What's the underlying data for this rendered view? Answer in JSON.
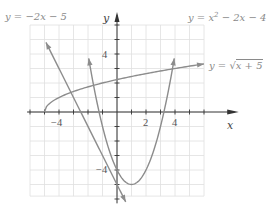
{
  "chart_data": {
    "type": "line",
    "title": "",
    "xlabel": "x",
    "ylabel": "y",
    "xlim": [
      -6,
      6
    ],
    "ylim": [
      -6,
      6
    ],
    "grid": true,
    "x_ticks_labeled": [
      -4,
      2,
      4
    ],
    "y_ticks_labeled": [
      4,
      -4
    ],
    "tick_labels": {
      "x_neg4": "−4",
      "x_2": "2",
      "x_4": "4",
      "y_4": "4",
      "y_neg4": "−4"
    },
    "series": [
      {
        "name": "y = −2x − 5",
        "expression": "-2x-5",
        "x": [
          -4.5,
          -4,
          -2,
          0,
          0.5
        ],
        "y": [
          4,
          3,
          -1,
          -5,
          -6
        ]
      },
      {
        "name": "y = x² − 2x − 4",
        "expression": "x^2-2x-4",
        "x": [
          -2.1,
          -1,
          0,
          1,
          2,
          3,
          4.1
        ],
        "y": [
          4.6,
          -1,
          -4,
          -5,
          -4,
          -1,
          4.6
        ]
      },
      {
        "name": "y = √(x + 5)",
        "expression": "sqrt(x+5)",
        "x": [
          -5,
          -4,
          -1,
          0,
          4,
          6
        ],
        "y": [
          0,
          1,
          2,
          2.24,
          3,
          3.32
        ]
      }
    ],
    "annotations": [
      {
        "text": "y = −2x − 5",
        "position": "top-left"
      },
      {
        "text": "y = x² − 2x − 4",
        "position": "top-right"
      },
      {
        "text": "y = √x + 5",
        "position": "right"
      }
    ]
  },
  "labels": {
    "line": "y = −2x − 5",
    "parabola_pre": "y = x",
    "parabola_exp": "2",
    "parabola_post": " − 2x − 4",
    "sqrt_pre": "y = ",
    "sqrt_radicand": "x + 5",
    "x_axis": "x",
    "y_axis": "y"
  },
  "colors": {
    "curve": "#8c8c8c",
    "axis": "#333333",
    "grid": "#dedede",
    "label": "#8a8a8a"
  }
}
